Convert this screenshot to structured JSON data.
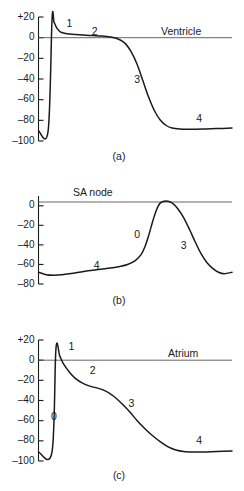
{
  "figure": {
    "panel_count": 3
  },
  "chart_data": [
    {
      "type": "line",
      "id": "ventricle",
      "title": "Ventricle",
      "caption": "(a)",
      "xlabel": "",
      "ylabel": "",
      "ylim": [
        -100,
        20
      ],
      "yticks": [
        20,
        0,
        -20,
        -40,
        -60,
        -80,
        -100
      ],
      "ytick_labels": [
        "+20",
        "0",
        "–20",
        "–40",
        "–60",
        "–80",
        "–100"
      ],
      "grid": false,
      "legend": "none",
      "zero_reference_line": true,
      "annotations": [
        {
          "text": "1",
          "x": 16,
          "y": 13
        },
        {
          "text": "2",
          "x": 29,
          "y": 5
        },
        {
          "text": "3",
          "x": 51,
          "y": -41
        },
        {
          "text": "4",
          "x": 83,
          "y": -79
        }
      ],
      "x": [
        0,
        5,
        7,
        8,
        9,
        10,
        11,
        12,
        14,
        16,
        19,
        23,
        28,
        33,
        38,
        42,
        45,
        48,
        51,
        54,
        57,
        60,
        63,
        66,
        69,
        73,
        78,
        85,
        92,
        100
      ],
      "y": [
        -90,
        -90,
        18,
        15,
        11,
        8,
        6,
        5,
        4,
        3.5,
        3,
        2.5,
        2,
        1.5,
        0.5,
        -2,
        -6,
        -14,
        -26,
        -42,
        -58,
        -71,
        -80,
        -85,
        -87.5,
        -88.5,
        -88.7,
        -88.5,
        -88,
        -87.5
      ]
    },
    {
      "type": "line",
      "id": "sa-node",
      "title": "SA node",
      "caption": "(b)",
      "xlabel": "",
      "ylabel": "",
      "ylim": [
        -80,
        10
      ],
      "yticks": [
        0,
        -20,
        -40,
        -60,
        -80
      ],
      "ytick_labels": [
        "0",
        "–20",
        "–40",
        "–60",
        "–80"
      ],
      "grid": false,
      "legend": "none",
      "zero_reference_line": true,
      "annotations": [
        {
          "text": "4",
          "x": 30,
          "y": -62
        },
        {
          "text": "0",
          "x": 51,
          "y": -30
        },
        {
          "text": "3",
          "x": 75,
          "y": -41
        }
      ],
      "x": [
        0,
        4,
        8,
        12,
        18,
        24,
        30,
        36,
        42,
        46,
        50,
        53,
        55,
        57,
        59,
        61,
        63,
        66,
        69,
        72,
        75,
        78,
        81,
        84,
        87,
        90,
        93,
        96,
        100
      ],
      "y": [
        -68,
        -70.5,
        -71,
        -70.5,
        -69,
        -67,
        -65.5,
        -64,
        -62,
        -60,
        -56,
        -50,
        -42,
        -30,
        -16,
        -4,
        3,
        5,
        3,
        -3,
        -12,
        -24,
        -37,
        -49,
        -58,
        -64,
        -68,
        -69.5,
        -68
      ]
    },
    {
      "type": "line",
      "id": "atrium",
      "title": "Atrium",
      "caption": "(c)",
      "xlabel": "",
      "ylabel": "",
      "ylim": [
        -100,
        20
      ],
      "yticks": [
        20,
        0,
        -20,
        -40,
        -60,
        -80,
        -100
      ],
      "ytick_labels": [
        "+20",
        "0",
        "–20",
        "–40",
        "–60",
        "–80",
        "–100"
      ],
      "grid": false,
      "legend": "none",
      "zero_reference_line": true,
      "annotations": [
        {
          "text": "0",
          "x": 8,
          "y": -57
        },
        {
          "text": "1",
          "x": 17,
          "y": 13
        },
        {
          "text": "2",
          "x": 28,
          "y": -11
        },
        {
          "text": "3",
          "x": 48,
          "y": -44
        },
        {
          "text": "4",
          "x": 83,
          "y": -80
        }
      ],
      "x": [
        0,
        7,
        9,
        11,
        13,
        16,
        19,
        23,
        27,
        31,
        35,
        39,
        43,
        47,
        51,
        55,
        59,
        63,
        67,
        71,
        75,
        80,
        86,
        92,
        100
      ],
      "y": [
        -91,
        -91,
        11,
        4,
        -4,
        -12,
        -18,
        -23,
        -26,
        -28,
        -31,
        -36,
        -43,
        -51,
        -60,
        -68,
        -75,
        -81,
        -86,
        -89,
        -90.5,
        -91,
        -91,
        -90.5,
        -90
      ]
    }
  ],
  "colors": {
    "trace": "#1a1a1a",
    "axis": "#1a1a1a",
    "zero_line": "#555555",
    "background": "#ffffff"
  }
}
